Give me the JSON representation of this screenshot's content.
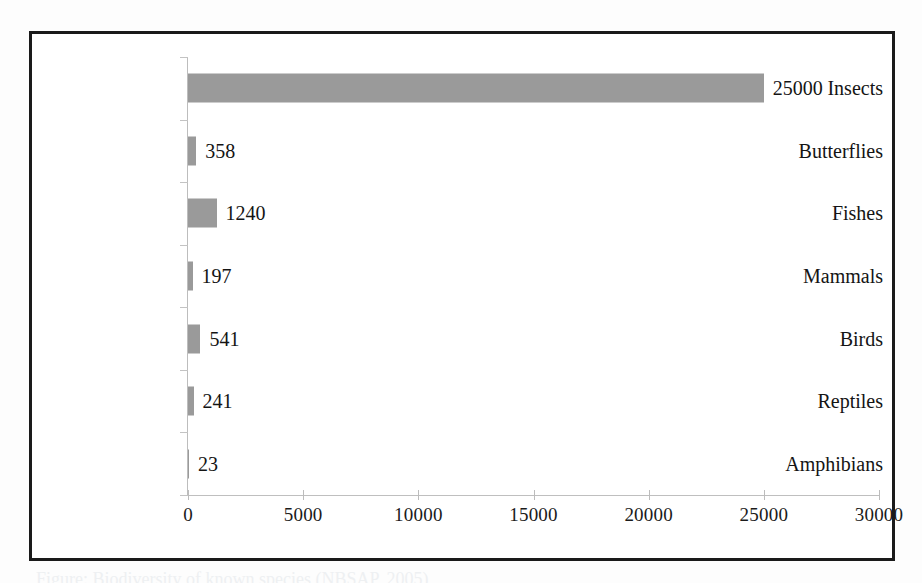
{
  "figure": {
    "caption": "Figure: Biodiversity of known species (NBSAP, 2005)",
    "frame_color": "#1a1a1a",
    "background_color": "#ffffff"
  },
  "chart_data": {
    "type": "bar",
    "orientation": "horizontal",
    "title": "",
    "xlabel": "",
    "ylabel": "",
    "categories": [
      "Insects",
      "Butterflies",
      "Fishes",
      "Mammals",
      "Birds",
      "Reptiles",
      "Amphibians"
    ],
    "values": [
      25000,
      358,
      1240,
      197,
      541,
      241,
      23
    ],
    "value_labels": [
      "25000",
      "358",
      "1240",
      "197",
      "541",
      "241",
      "23"
    ],
    "xlim": [
      0,
      30000
    ],
    "xticks": [
      0,
      5000,
      10000,
      15000,
      20000,
      25000,
      30000
    ],
    "xtick_labels": [
      "0",
      "5000",
      "10000",
      "15000",
      "20000",
      "25000",
      "30000"
    ],
    "grid": false,
    "legend": false,
    "legend_position": "none",
    "bar_color": "#9a9a9a",
    "axis_color": "#bdbdbd",
    "text_color": "#141414"
  }
}
